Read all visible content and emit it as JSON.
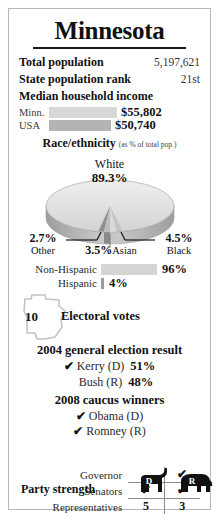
{
  "card": {
    "title": "Minnesota",
    "stats": [
      {
        "label": "Total population",
        "value": "5,197,621"
      },
      {
        "label": "State population rank",
        "value": "21st"
      }
    ],
    "income": {
      "heading": "Median household income",
      "rows": [
        {
          "name": "Minn.",
          "value": "$55,802",
          "bar_width": 68,
          "color": "#d8d8d8"
        },
        {
          "name": "USA",
          "value": "$50,740",
          "bar_width": 62,
          "color": "#b4b4b4"
        }
      ]
    },
    "race": {
      "heading": "Race/ethnicity",
      "note": "(as % of total pop.)",
      "main_label": "White",
      "main_pct": "89.3%",
      "slices": [
        {
          "label": "Other",
          "pct": "2.7%"
        },
        {
          "label": "Asian",
          "pct": "3.5%"
        },
        {
          "label": "Black",
          "pct": "4.5%"
        }
      ]
    },
    "ethnicity": {
      "rows": [
        {
          "name": "Non-Hispanic",
          "value": "96%",
          "bar_width": 56,
          "color": "#d5d5d5"
        },
        {
          "name": "Hispanic",
          "value": "4%",
          "bar_width": 3,
          "color": "#9a9a9a"
        }
      ]
    },
    "electoral": {
      "number": "10",
      "label": "Electoral votes"
    },
    "general_election": {
      "heading": "2004 general election result",
      "candidates": [
        {
          "check": "✔",
          "name": "Kerry (D)",
          "pct": "51%"
        },
        {
          "check": "",
          "name": "Bush (R)",
          "pct": "48%"
        }
      ]
    },
    "caucus": {
      "heading": "2008 caucus winners",
      "winners": [
        {
          "check": "✔",
          "name": "Obama (D)"
        },
        {
          "check": "✔",
          "name": "Romney (R)"
        }
      ]
    },
    "party_strength": {
      "heading": "Party strength",
      "dem_letter": "D",
      "rep_letter": "R",
      "rows": [
        {
          "label": "Governor",
          "dem": "",
          "rep": "✔"
        },
        {
          "label": "Senators",
          "dem": "✔",
          "rep": "✔"
        },
        {
          "label": "Representatives",
          "dem": "5",
          "rep": "3"
        }
      ]
    }
  }
}
